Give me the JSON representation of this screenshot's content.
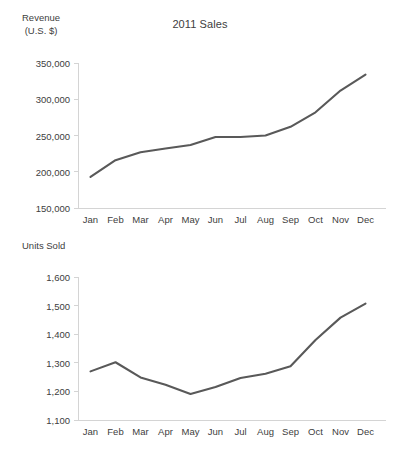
{
  "figure": {
    "title": "2011 Sales",
    "background_color": "#ffffff",
    "line_color": "#595959",
    "axis_color": "#d4d4d4",
    "text_color": "#404040"
  },
  "chart_data": [
    {
      "type": "line",
      "id": "revenue-chart",
      "title": "2011 Sales",
      "xlabel": "",
      "ylabel": "Revenue\n(U.S. $)",
      "ylabel_lines": [
        "Revenue",
        "(U.S. $)"
      ],
      "categories": [
        "Jan",
        "Feb",
        "Mar",
        "Apr",
        "May",
        "Jun",
        "Jul",
        "Aug",
        "Sep",
        "Oct",
        "Nov",
        "Dec"
      ],
      "values": [
        193000,
        216000,
        227000,
        232000,
        237000,
        248000,
        248000,
        250000,
        262000,
        282000,
        312000,
        334000
      ],
      "ylim": [
        150000,
        350000
      ],
      "ytick_values": [
        150000,
        200000,
        250000,
        300000,
        350000
      ],
      "ytick_labels": [
        "150,000",
        "200,000",
        "250,000",
        "300,000",
        "350,000"
      ],
      "grid": false,
      "legend": false,
      "series_name": "Revenue"
    },
    {
      "type": "line",
      "id": "units-sold-chart",
      "title": "",
      "xlabel": "",
      "ylabel": "Units Sold",
      "ylabel_lines": [
        "Units Sold"
      ],
      "categories": [
        "Jan",
        "Feb",
        "Mar",
        "Apr",
        "May",
        "Jun",
        "Jul",
        "Aug",
        "Sep",
        "Oct",
        "Nov",
        "Dec"
      ],
      "values": [
        1270,
        1302,
        1249,
        1223,
        1191,
        1215,
        1247,
        1262,
        1288,
        1380,
        1458,
        1507
      ],
      "ylim": [
        1100,
        1600
      ],
      "ytick_values": [
        1100,
        1200,
        1300,
        1400,
        1500,
        1600
      ],
      "ytick_labels": [
        "1,100",
        "1,200",
        "1,300",
        "1,400",
        "1,500",
        "1,600"
      ],
      "grid": false,
      "legend": false,
      "series_name": "Units Sold"
    }
  ]
}
